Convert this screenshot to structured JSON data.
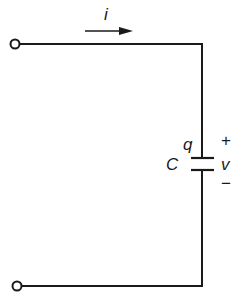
{
  "diagram": {
    "type": "circuit",
    "labels": {
      "current": "i",
      "charge": "q",
      "capacitance": "C",
      "voltage": "v",
      "plus": "+",
      "minus": "−"
    },
    "colors": {
      "stroke": "#1a1a1a",
      "background": "#ffffff"
    }
  }
}
